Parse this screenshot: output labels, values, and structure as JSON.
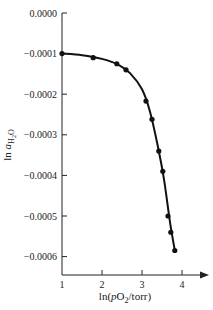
{
  "chart_data": {
    "type": "line",
    "title": "",
    "xlabel": "ln(pO2/torr)",
    "ylabel": "ln a_H2O",
    "xlim": [
      1,
      4.6
    ],
    "ylim": [
      -0.00065,
      0.0
    ],
    "grid": false,
    "legend": null,
    "x_ticks": [
      1,
      2,
      3,
      4
    ],
    "x_tick_labels": [
      "1",
      "2",
      "3",
      "4"
    ],
    "y_ticks": [
      0.0,
      -0.0001,
      -0.0002,
      -0.0003,
      -0.0004,
      -0.0005,
      -0.0006
    ],
    "y_tick_labels": [
      "0.0000",
      "−0.0001",
      "−0.0002",
      "−0.0003",
      "−0.0004",
      "−0.0005",
      "−0.0006"
    ],
    "series": [
      {
        "name": "data points",
        "style": "markers",
        "x": [
          1.0,
          1.78,
          2.37,
          2.6,
          3.1,
          3.25,
          3.42,
          3.52,
          3.65,
          3.72,
          3.82
        ],
        "y": [
          -0.0001,
          -0.00011,
          -0.000125,
          -0.00014,
          -0.000217,
          -0.000262,
          -0.00034,
          -0.00039,
          -0.0005,
          -0.00054,
          -0.000585
        ]
      },
      {
        "name": "fitted curve",
        "style": "smooth-line",
        "x": [
          1.0,
          1.5,
          2.0,
          2.4,
          2.7,
          3.0,
          3.2,
          3.4,
          3.55,
          3.7,
          3.82
        ],
        "y": [
          -0.0001,
          -0.000104,
          -0.000113,
          -0.000127,
          -0.000148,
          -0.000188,
          -0.000243,
          -0.00033,
          -0.00041,
          -0.000515,
          -0.000585
        ]
      }
    ]
  },
  "labels": {
    "xlabel_prefix": "ln(",
    "xlabel_italic": "p",
    "xlabel_mid": "O",
    "xlabel_sub": "2",
    "xlabel_suffix": "/torr)",
    "ylabel_prefix": "ln ",
    "ylabel_italic": "a",
    "ylabel_sub": "H",
    "ylabel_sub2": "2",
    "ylabel_sub3": "O"
  }
}
